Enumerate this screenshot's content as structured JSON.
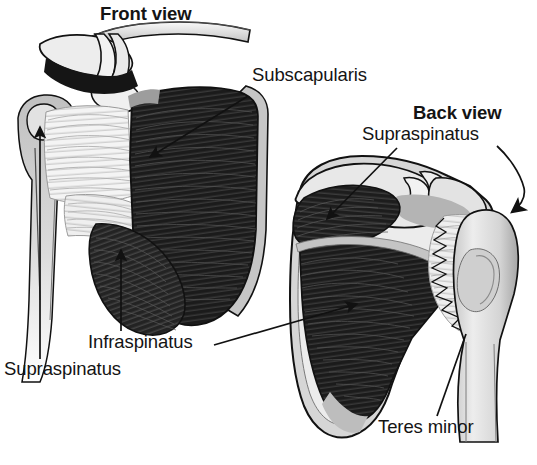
{
  "figure": {
    "background_color": "#ffffff",
    "ink_color": "#141414",
    "palette": {
      "muscle_dark": "#1b1b1b",
      "muscle_mid": "#3a3a3a",
      "bone_light": "#e6e6e6",
      "bone_mid": "#b9b9b9",
      "bone_shadow": "#8d8d8d",
      "tendon_white": "#f2f2f2",
      "outline": "#111111"
    }
  },
  "headings": {
    "front": "Front view",
    "back": "Back view"
  },
  "labels": {
    "subscapularis": "Subscapularis",
    "supraspinatus_back": "Supraspinatus",
    "infraspinatus": "Infraspinatus",
    "supraspinatus_front": "Supraspinatus",
    "teres_minor": "Teres minor"
  },
  "annotations": [
    {
      "id": "front-view-heading",
      "text": "Front view",
      "x": 100,
      "y": 5,
      "bold": true,
      "leader": false
    },
    {
      "id": "subscapularis-label",
      "text": "Subscapularis",
      "x": 252,
      "y": 66,
      "bold": false,
      "leader": true,
      "leader_kind": "straight-arrow",
      "leader_from": [
        248,
        96
      ],
      "leader_to": [
        143,
        160
      ]
    },
    {
      "id": "back-view-heading",
      "text": "Back view",
      "x": 413,
      "y": 104,
      "bold": true,
      "leader": false
    },
    {
      "id": "supraspinatus-back-label",
      "text": "Supraspinatus",
      "x": 362,
      "y": 125,
      "bold": false,
      "leader": true,
      "leader_kind": "straight-arrow",
      "leader_from": [
        397,
        146
      ],
      "leader_to": [
        323,
        222
      ]
    },
    {
      "id": "supraspinatus-back-hook",
      "text": "",
      "leader": true,
      "leader_kind": "hooked-arrow",
      "leader_from": [
        497,
        146
      ],
      "leader_to": [
        509,
        219
      ]
    },
    {
      "id": "infraspinatus-label",
      "text": "Infraspinatus",
      "x": 88,
      "y": 333,
      "bold": false,
      "leader": true,
      "leader_kind": "vertical-arrow",
      "leader_from": [
        121,
        330
      ],
      "leader_to": [
        121,
        246
      ]
    },
    {
      "id": "infraspinatus-right-leader",
      "text": "",
      "leader": true,
      "leader_kind": "straight-arrow",
      "leader_from": [
        214,
        344
      ],
      "leader_to": [
        363,
        303
      ]
    },
    {
      "id": "supraspinatus-front-label",
      "text": "Supraspinatus",
      "x": 4,
      "y": 360,
      "bold": false,
      "leader": true,
      "leader_kind": "vertical-arrow",
      "leader_from": [
        40,
        358
      ],
      "leader_to": [
        40,
        123
      ]
    },
    {
      "id": "teres-minor-label",
      "text": "Teres minor",
      "x": 378,
      "y": 418,
      "bold": false,
      "leader": true,
      "leader_kind": "straight",
      "leader_from": [
        437,
        415
      ],
      "leader_to": [
        466,
        333
      ]
    }
  ],
  "views": [
    {
      "id": "front-view",
      "heading": "Front view",
      "muscles_shown": [
        "Subscapularis",
        "Supraspinatus",
        "Infraspinatus"
      ],
      "bones_shown": [
        "clavicle",
        "acromion",
        "coracoid process",
        "humerus",
        "scapula"
      ]
    },
    {
      "id": "back-view",
      "heading": "Back view",
      "muscles_shown": [
        "Supraspinatus",
        "Infraspinatus",
        "Teres minor"
      ],
      "bones_shown": [
        "acromion",
        "spine of scapula",
        "humerus",
        "scapula"
      ]
    }
  ]
}
